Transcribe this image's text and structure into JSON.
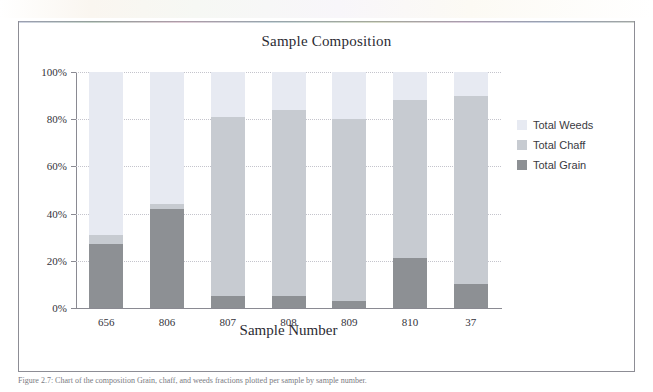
{
  "figure": {
    "caption": "Figure 2.7:  Chart of the composition Grain, chaff, and weeds fractions plotted per sample by sample number."
  },
  "legend": {
    "position": "right",
    "items": [
      {
        "label": "Total Weeds",
        "color": "#e7eaf2"
      },
      {
        "label": "Total Chaff",
        "color": "#c7cbd1"
      },
      {
        "label": "Total Grain",
        "color": "#8d9094"
      }
    ]
  },
  "chart_data": {
    "type": "bar",
    "stacked": true,
    "title": "Sample Composition",
    "xlabel": "Sample Number",
    "ylabel": "",
    "grid": true,
    "ylim": [
      0,
      100
    ],
    "yticks": [
      0,
      20,
      40,
      60,
      80,
      100
    ],
    "ytick_labels": [
      "0%",
      "20%",
      "40%",
      "60%",
      "80%",
      "100%"
    ],
    "categories": [
      "656",
      "806",
      "807",
      "808",
      "809",
      "810",
      "37"
    ],
    "series": [
      {
        "name": "Total Grain",
        "color": "#8d9094",
        "values": [
          27,
          42,
          5,
          5,
          3,
          21,
          10
        ]
      },
      {
        "name": "Total Chaff",
        "color": "#c7cbd1",
        "values": [
          4,
          2,
          76,
          79,
          77,
          67,
          80
        ]
      },
      {
        "name": "Total Weeds",
        "color": "#e7eaf2",
        "values": [
          69,
          56,
          19,
          16,
          20,
          12,
          10
        ]
      }
    ]
  }
}
